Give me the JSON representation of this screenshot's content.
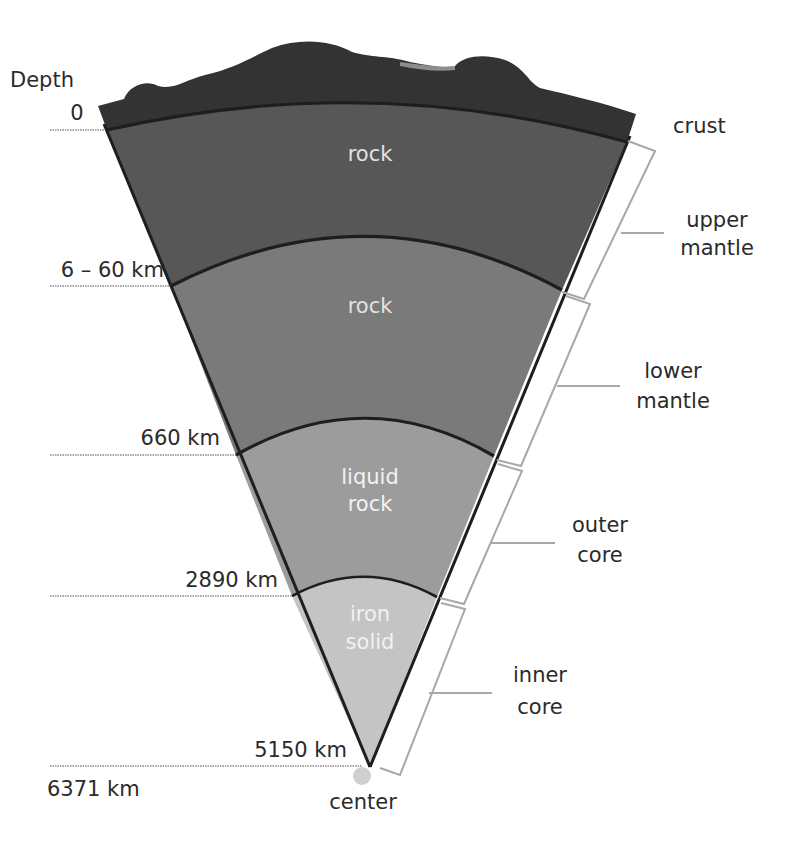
{
  "diagram": {
    "depth_header": "Depth",
    "depth_labels": [
      {
        "id": "surface",
        "text": "0"
      },
      {
        "id": "crust-base",
        "text": "6 – 60 km"
      },
      {
        "id": "upper-mantle-base",
        "text": "660 km"
      },
      {
        "id": "lower-mantle-base",
        "text": "2890 km"
      },
      {
        "id": "outer-core-base",
        "text": "5150 km"
      },
      {
        "id": "center-depth",
        "text": "6371 km"
      }
    ],
    "layer_materials": [
      {
        "id": "upper-mantle",
        "text": "rock"
      },
      {
        "id": "lower-mantle",
        "text": "rock"
      },
      {
        "id": "outer-core",
        "line1": "liquid",
        "line2": "rock"
      },
      {
        "id": "inner-core",
        "line1": "iron",
        "line2": "solid"
      }
    ],
    "layer_names": [
      {
        "id": "crust",
        "line1": "crust"
      },
      {
        "id": "upper-mantle",
        "line1": "upper",
        "line2": "mantle"
      },
      {
        "id": "lower-mantle",
        "line1": "lower",
        "line2": "mantle"
      },
      {
        "id": "outer-core",
        "line1": "outer",
        "line2": "core"
      },
      {
        "id": "inner-core",
        "line1": "inner",
        "line2": "core"
      }
    ],
    "center_label": "center",
    "colors": {
      "crust": "#3a3a3a",
      "upper_mantle": "#5a5a5a",
      "lower_mantle": "#7a7a7a",
      "outer_core": "#9c9c9c",
      "inner_core": "#c4c4c4",
      "outline": "#1e1e1e",
      "bracket": "#a8a8a8",
      "center_dot": "#cfcfcf"
    }
  }
}
